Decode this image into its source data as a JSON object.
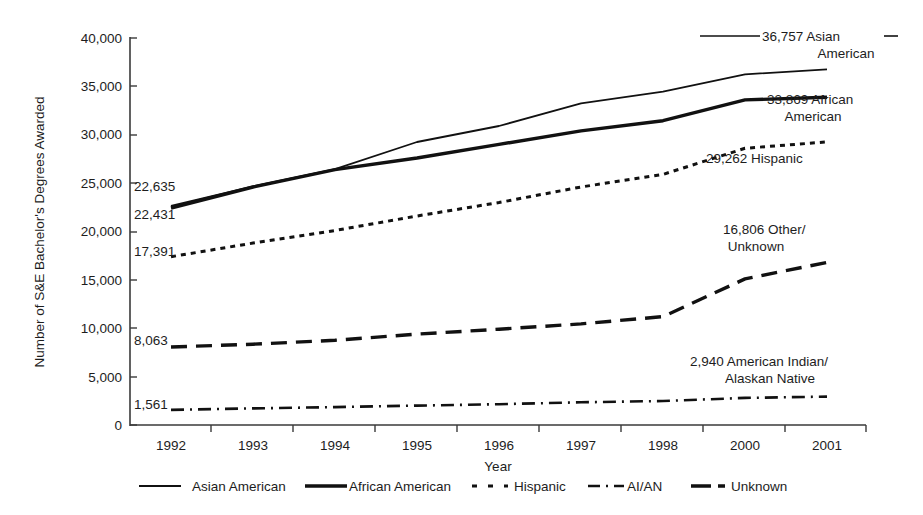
{
  "chart_data": {
    "type": "line",
    "title": "",
    "xlabel": "Year",
    "ylabel": "Number of S&E Bachelor's Degrees Awarded",
    "x": [
      "1992",
      "1993",
      "1994",
      "1995",
      "1996",
      "1997",
      "1998",
      "2000",
      "2001"
    ],
    "ylim": [
      0,
      40000
    ],
    "yticks": [
      0,
      5000,
      10000,
      15000,
      20000,
      25000,
      30000,
      35000,
      40000
    ],
    "ytick_labels": [
      "0",
      "5,000",
      "10,000",
      "15,000",
      "20,000",
      "25,000",
      "30,000",
      "35,000",
      "40,000"
    ],
    "grid": false,
    "legend_position": "bottom",
    "series": [
      {
        "name": "Asian American",
        "style": "solid-thin",
        "start_label": "22,635",
        "end_label": "36,757 Asian American",
        "end_label_line1": "36,757 Asian",
        "end_label_line2": "American",
        "values": [
          22635,
          24650,
          26450,
          29250,
          30900,
          33250,
          34450,
          36250,
          36757
        ]
      },
      {
        "name": "African American",
        "style": "solid-thick",
        "start_label": "22,431",
        "end_label": "33,869 African American",
        "end_label_line1": "33,869 African",
        "end_label_line2": "American",
        "values": [
          22431,
          24600,
          26400,
          27600,
          29000,
          30400,
          31450,
          33600,
          33869
        ]
      },
      {
        "name": "Hispanic",
        "style": "dotted",
        "start_label": "17,391",
        "end_label": "29,262 Hispanic",
        "end_label_line1": "29,262 Hispanic",
        "end_label_line2": "",
        "values": [
          17391,
          18800,
          20100,
          21600,
          23000,
          24600,
          25900,
          28600,
          29262
        ]
      },
      {
        "name": "Unknown",
        "style": "dashed-long",
        "start_label": "8,063",
        "end_label": "16,806 Other/Unknown",
        "end_label_line1": "16,806 Other/",
        "end_label_line2": "Unknown",
        "values": [
          8063,
          8350,
          8750,
          9400,
          9900,
          10450,
          11200,
          15100,
          16806
        ]
      },
      {
        "name": "AI/AN",
        "style": "dash-dot",
        "start_label": "1,561",
        "end_label": "2,940 American Indian/Alaskan Native",
        "end_label_line1": "2,940 American Indian/",
        "end_label_line2": "Alaskan Native",
        "values": [
          1561,
          1720,
          1850,
          2000,
          2150,
          2350,
          2480,
          2800,
          2940
        ]
      }
    ]
  },
  "legend": {
    "items": [
      {
        "label": "Asian American",
        "style": "solid-thin"
      },
      {
        "label": "African American",
        "style": "solid-thick"
      },
      {
        "label": "Hispanic",
        "style": "dotted"
      },
      {
        "label": "AI/AN",
        "style": "dash-dot"
      },
      {
        "label": "Unknown",
        "style": "dashed-long"
      }
    ]
  },
  "axes": {
    "y_title": "Number of S&E Bachelor's Degrees Awarded",
    "x_title": "Year"
  },
  "ticks": {
    "y": [
      "40,000",
      "35,000",
      "30,000",
      "25,000",
      "20,000",
      "15,000",
      "10,000",
      "5,000",
      "0"
    ],
    "x": [
      "1992",
      "1993",
      "1994",
      "1995",
      "1996",
      "1997",
      "1998",
      "2000",
      "2001"
    ]
  },
  "start_labels": {
    "asian": "22,635",
    "african": "22,431",
    "hispanic": "17,391",
    "unknown": "8,063",
    "aian": "1,561"
  },
  "end_labels": {
    "asian_l1": "36,757 Asian",
    "asian_l2": "American",
    "african_l1": "33,869 African",
    "african_l2": "American",
    "hispanic_l1": "29,262 Hispanic",
    "unknown_l1": "16,806 Other/",
    "unknown_l2": "Unknown",
    "aian_l1": "2,940 American Indian/",
    "aian_l2": "Alaskan Native"
  }
}
